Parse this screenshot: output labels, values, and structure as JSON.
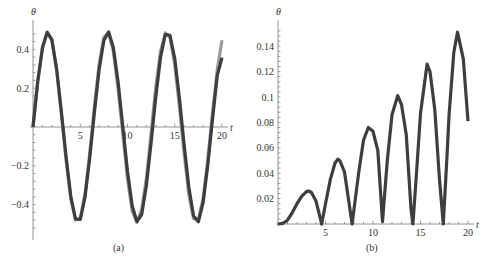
{
  "chart_data": [
    {
      "type": "line",
      "panel": "a",
      "caption": "(a)",
      "xlabel": "t",
      "ylabel": "θ",
      "xlim": [
        0,
        20
      ],
      "ylim": [
        -0.52,
        0.5
      ],
      "xticks": [
        5,
        10,
        15,
        20
      ],
      "xtick_labels": [
        "5",
        "10",
        "15",
        "20"
      ],
      "yticks": [
        0.4,
        0.2,
        -0.2,
        -0.4
      ],
      "ytick_labels": [
        "0.4",
        "0.2",
        "−0.2",
        "−0.4"
      ],
      "grid": false,
      "series": [
        {
          "name": "light",
          "color": "#9a9a9a",
          "x": [
            0,
            0.5,
            1,
            1.5,
            2,
            2.5,
            3,
            3.5,
            4,
            4.5,
            5,
            5.5,
            6,
            6.5,
            7,
            7.5,
            8,
            8.5,
            9,
            9.5,
            10,
            10.5,
            11,
            11.5,
            12,
            12.5,
            13,
            13.5,
            14,
            14.5,
            15,
            15.5,
            16,
            16.5,
            17,
            17.5,
            18,
            18.5,
            19,
            19.5,
            20
          ],
          "values": [
            0,
            0.235,
            0.412,
            0.489,
            0.446,
            0.293,
            0.069,
            -0.172,
            -0.371,
            -0.479,
            -0.47,
            -0.346,
            -0.137,
            0.106,
            0.322,
            0.463,
            0.485,
            0.391,
            0.202,
            -0.037,
            -0.267,
            -0.432,
            -0.49,
            -0.426,
            -0.263,
            -0.032,
            0.206,
            0.393,
            0.485,
            0.462,
            0.319,
            0.102,
            -0.141,
            -0.349,
            -0.472,
            -0.478,
            -0.368,
            -0.168,
            0.074,
            0.296,
            0.447
          ]
        },
        {
          "name": "dark",
          "color": "#3e3e3e",
          "x": [
            0,
            0.5,
            1,
            1.5,
            2,
            2.5,
            3,
            3.5,
            4,
            4.5,
            5,
            5.5,
            6,
            6.5,
            7,
            7.5,
            8,
            8.5,
            9,
            9.5,
            10,
            10.5,
            11,
            11.5,
            12,
            12.5,
            13,
            13.5,
            14,
            14.5,
            15,
            15.5,
            16,
            16.5,
            17,
            17.5,
            18,
            18.5,
            19,
            19.5,
            20
          ],
          "values": [
            0,
            0.232,
            0.408,
            0.488,
            0.45,
            0.301,
            0.083,
            -0.154,
            -0.357,
            -0.474,
            -0.476,
            -0.362,
            -0.161,
            0.075,
            0.295,
            0.447,
            0.49,
            0.412,
            0.236,
            0.003,
            -0.228,
            -0.406,
            -0.488,
            -0.451,
            -0.301,
            -0.082,
            0.157,
            0.361,
            0.477,
            0.472,
            0.352,
            0.146,
            -0.095,
            -0.313,
            -0.459,
            -0.488,
            -0.39,
            -0.196,
            0.039,
            0.266,
            0.357
          ]
        }
      ]
    },
    {
      "type": "line",
      "panel": "b",
      "caption": "(b)",
      "xlabel": "t",
      "ylabel": "θ",
      "xlim": [
        0,
        20
      ],
      "ylim": [
        0,
        0.155
      ],
      "xticks": [
        5,
        10,
        15,
        20
      ],
      "xtick_labels": [
        "5",
        "10",
        "15",
        "20"
      ],
      "yticks": [
        0.02,
        0.04,
        0.06,
        0.08,
        0.1,
        0.12,
        0.14
      ],
      "ytick_labels": [
        "0.02",
        "0.04",
        "0.06",
        "0.08",
        "0.1",
        "0.12",
        "0.14"
      ],
      "grid": false,
      "series": [
        {
          "name": "difference",
          "color": "#3e3e3e",
          "x": [
            0,
            0.5,
            1,
            1.5,
            2,
            2.5,
            3,
            3.2,
            3.5,
            4,
            4.6,
            5,
            5.5,
            6,
            6.3,
            6.5,
            7,
            7.8,
            8.5,
            9,
            9.5,
            10,
            10.5,
            11,
            11.5,
            12,
            12.6,
            13,
            13.5,
            14,
            14.2,
            14.5,
            15,
            15.7,
            16,
            16.5,
            17,
            17.4,
            17.8,
            18,
            18.5,
            18.9,
            19.5,
            20
          ],
          "values": [
            0,
            0.0005,
            0.003,
            0.009,
            0.016,
            0.022,
            0.0255,
            0.026,
            0.025,
            0.018,
            0,
            0.016,
            0.035,
            0.048,
            0.051,
            0.05,
            0.041,
            0,
            0.041,
            0.066,
            0.076,
            0.073,
            0.058,
            0.002,
            0.05,
            0.086,
            0.101,
            0.094,
            0.07,
            0.012,
            0,
            0.032,
            0.087,
            0.126,
            0.12,
            0.09,
            0.035,
            0,
            0.055,
            0.085,
            0.135,
            0.151,
            0.13,
            0.081
          ]
        }
      ]
    }
  ]
}
